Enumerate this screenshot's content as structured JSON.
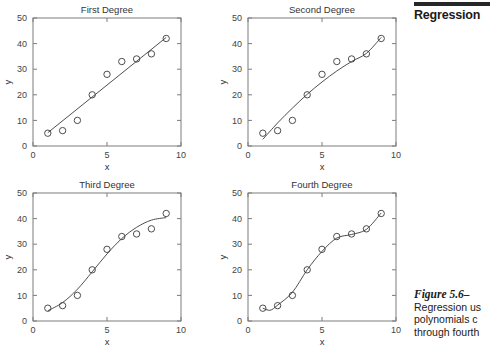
{
  "book_header": {
    "running_head": "Regression"
  },
  "figure_caption": {
    "title": "Figure 5.6–",
    "line1": "Regression us",
    "line2": "polynomials c",
    "line3": "through fourth"
  },
  "axes": {
    "xlabel": "x",
    "ylabel": "y",
    "xticks": [
      "0",
      "5",
      "10"
    ],
    "xtick_values": [
      0,
      5,
      10
    ],
    "yticks": [
      "0",
      "10",
      "20",
      "30",
      "40",
      "50"
    ],
    "ytick_values": [
      0,
      10,
      20,
      30,
      40,
      50
    ],
    "xlim": [
      0,
      10
    ],
    "ylim": [
      0,
      50
    ],
    "grid": false
  },
  "chart_data": [
    {
      "type": "scatter",
      "title": "First Degree",
      "xlabel": "x",
      "ylabel": "y",
      "xlim": [
        0,
        10
      ],
      "ylim": [
        0,
        50
      ],
      "grid": false,
      "legend": "none",
      "x": [
        1,
        2,
        3,
        4,
        5,
        6,
        7,
        8,
        9
      ],
      "values": [
        5,
        6,
        10,
        20,
        28,
        33,
        34,
        36,
        42
      ],
      "series": [
        {
          "name": "data points",
          "marker": "circle-open",
          "values": [
            5,
            6,
            10,
            20,
            28,
            33,
            34,
            36,
            42
          ]
        },
        {
          "name": "first degree fit",
          "marker": "line",
          "fit_x": [
            1,
            9
          ],
          "fit_y": [
            5.2,
            42.4
          ]
        }
      ]
    },
    {
      "type": "scatter",
      "title": "Second Degree",
      "xlabel": "x",
      "ylabel": "y",
      "xlim": [
        0,
        10
      ],
      "ylim": [
        0,
        50
      ],
      "grid": false,
      "legend": "none",
      "x": [
        1,
        2,
        3,
        4,
        5,
        6,
        7,
        8,
        9
      ],
      "values": [
        5,
        6,
        10,
        20,
        28,
        33,
        34,
        36,
        42
      ],
      "series": [
        {
          "name": "data points",
          "marker": "circle-open",
          "values": [
            5,
            6,
            10,
            20,
            28,
            33,
            34,
            36,
            42
          ]
        },
        {
          "name": "second degree fit",
          "marker": "curve",
          "fit_x": [
            1,
            2,
            3,
            4,
            5,
            6,
            7,
            8,
            9
          ],
          "fit_y": [
            2.6,
            9.0,
            14.8,
            20.2,
            25.0,
            29.3,
            33.0,
            36.2,
            42.4
          ]
        }
      ]
    },
    {
      "type": "scatter",
      "title": "Third Degree",
      "xlabel": "x",
      "ylabel": "y",
      "xlim": [
        0,
        10
      ],
      "ylim": [
        0,
        50
      ],
      "grid": false,
      "legend": "none",
      "x": [
        1,
        2,
        3,
        4,
        5,
        6,
        7,
        8,
        9
      ],
      "values": [
        5,
        6,
        10,
        20,
        28,
        33,
        34,
        36,
        42
      ],
      "series": [
        {
          "name": "data points",
          "marker": "circle-open",
          "values": [
            5,
            6,
            10,
            20,
            28,
            33,
            34,
            36,
            42
          ]
        },
        {
          "name": "third degree fit",
          "marker": "curve",
          "fit_x": [
            1,
            2,
            3,
            4,
            5,
            6,
            7,
            8,
            9
          ],
          "fit_y": [
            4.0,
            7.2,
            12.4,
            19.2,
            26.2,
            32.2,
            36.6,
            39.4,
            40.4
          ]
        }
      ]
    },
    {
      "type": "scatter",
      "title": "Fourth Degree",
      "xlabel": "x",
      "ylabel": "y",
      "xlim": [
        0,
        10
      ],
      "ylim": [
        0,
        50
      ],
      "grid": false,
      "legend": "none",
      "x": [
        1,
        2,
        3,
        4,
        5,
        6,
        7,
        8,
        9
      ],
      "values": [
        5,
        6,
        10,
        20,
        28,
        33,
        34,
        36,
        42
      ],
      "series": [
        {
          "name": "data points",
          "marker": "circle-open",
          "values": [
            5,
            6,
            10,
            20,
            28,
            33,
            34,
            36,
            42
          ]
        },
        {
          "name": "fourth degree fit",
          "marker": "curve",
          "fit_x": [
            1,
            1.5,
            2,
            3,
            4,
            5,
            6,
            7,
            8,
            9
          ],
          "fit_y": [
            5.0,
            4.2,
            6.2,
            11.2,
            20.0,
            27.2,
            32.4,
            33.8,
            35.8,
            42.2
          ]
        }
      ]
    }
  ]
}
